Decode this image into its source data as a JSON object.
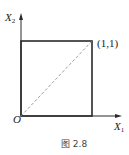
{
  "figure": {
    "caption": "图 2.8",
    "axes": {
      "y_label": "X",
      "y_label_sub": "2",
      "x_label": "X",
      "x_label_sub": "1",
      "origin_label": "O"
    },
    "point_label": "(1,1)",
    "shapes": {
      "square": {
        "from": [
          0,
          0
        ],
        "to": [
          1,
          1
        ]
      },
      "diagonal": {
        "from": [
          0,
          0
        ],
        "to": [
          1,
          1
        ],
        "style": "dashed"
      }
    },
    "colors": {
      "line": "#2a2a2a",
      "dashed": "#888888",
      "text": "#222222"
    }
  }
}
